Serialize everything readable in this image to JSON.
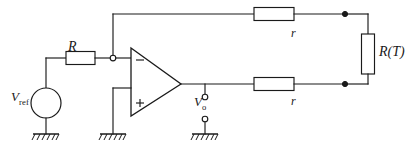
{
  "diagram": {
    "type": "electronic-schematic",
    "background_color": "#ffffff",
    "line_color": "#1a1a1a"
  },
  "labels": {
    "resistor_R": "R",
    "resistor_r_top": "r",
    "resistor_r_bottom": "r",
    "thermistor": "R(T)",
    "source_v": "V",
    "source_sub": "ref",
    "output_v": "V",
    "output_sub": "o"
  },
  "components": [
    {
      "name": "voltage-source-vref",
      "kind": "circle-source",
      "label": "V_ref"
    },
    {
      "name": "resistor-R",
      "kind": "resistor",
      "label": "R",
      "orientation": "horizontal"
    },
    {
      "name": "opamp",
      "kind": "operational-amplifier",
      "inverting_mark": "−",
      "noninverting_mark": "+"
    },
    {
      "name": "resistor-r-top",
      "kind": "resistor",
      "label": "r",
      "orientation": "horizontal"
    },
    {
      "name": "resistor-r-bottom",
      "kind": "resistor",
      "label": "r",
      "orientation": "horizontal"
    },
    {
      "name": "thermistor-RT",
      "kind": "resistor",
      "label": "R(T)",
      "orientation": "vertical"
    },
    {
      "name": "ground-vref",
      "kind": "ground"
    },
    {
      "name": "ground-noninverting",
      "kind": "ground"
    },
    {
      "name": "ground-output",
      "kind": "ground"
    }
  ],
  "nodes": [
    {
      "name": "node-inverting-input",
      "style": "open-circle"
    },
    {
      "name": "node-output-terminal-top",
      "style": "open-circle"
    },
    {
      "name": "node-output-terminal-bottom",
      "style": "open-circle"
    },
    {
      "name": "junction-top-right",
      "style": "filled-dot"
    },
    {
      "name": "junction-bottom-right",
      "style": "filled-dot"
    }
  ]
}
